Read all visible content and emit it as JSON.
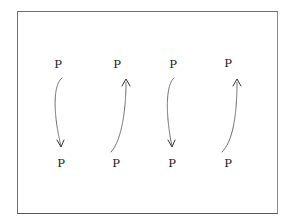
{
  "diagram": {
    "top_row": [
      {
        "label": "P",
        "x": 58,
        "y": 65
      },
      {
        "label": "P",
        "x": 117,
        "y": 65
      },
      {
        "label": "P",
        "x": 173,
        "y": 65
      },
      {
        "label": "P",
        "x": 228,
        "y": 64
      }
    ],
    "bottom_row": [
      {
        "label": "P",
        "x": 61,
        "y": 164
      },
      {
        "label": "P",
        "x": 116,
        "y": 164
      },
      {
        "label": "P",
        "x": 172,
        "y": 164
      },
      {
        "label": "P",
        "x": 228,
        "y": 164
      }
    ],
    "arrows": [
      {
        "direction": "down",
        "from": "top_row.0",
        "to": "bottom_row.0"
      },
      {
        "direction": "up",
        "from": "bottom_row.1",
        "to": "top_row.1"
      },
      {
        "direction": "down",
        "from": "top_row.2",
        "to": "bottom_row.2"
      },
      {
        "direction": "up",
        "from": "bottom_row.3",
        "to": "top_row.3"
      }
    ],
    "colors": {
      "border": "#6f6f6f",
      "text": "#1a1a1a",
      "arrow": "#555555"
    }
  }
}
